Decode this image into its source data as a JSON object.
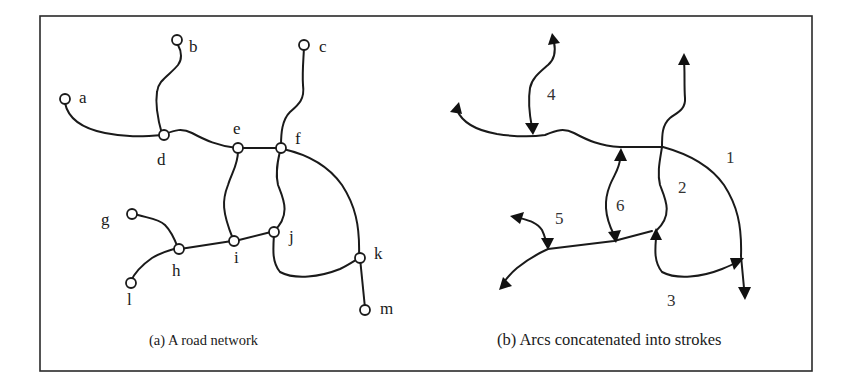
{
  "figure": {
    "panel_a": {
      "caption": "(a)  A road network",
      "nodes": [
        "a",
        "b",
        "c",
        "d",
        "e",
        "f",
        "g",
        "h",
        "i",
        "j",
        "k",
        "l",
        "m"
      ]
    },
    "panel_b": {
      "caption": "(b)  Arcs concatenated into strokes",
      "strokes": [
        "1",
        "2",
        "3",
        "4",
        "5",
        "6"
      ]
    },
    "colors": {
      "line": "#1a1a1a",
      "background": "#ffffff",
      "frame": "#2a2a2a"
    }
  }
}
